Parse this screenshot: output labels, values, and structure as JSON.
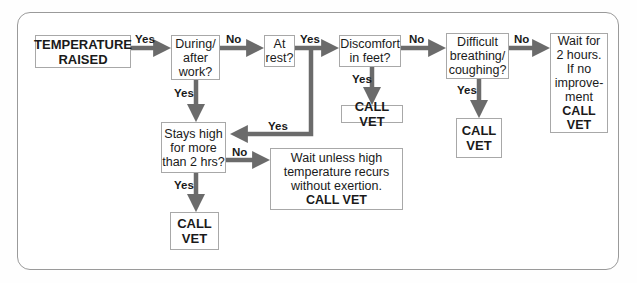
{
  "diagram": {
    "type": "flowchart",
    "arrow_color": "#6b6b6b",
    "border_color": "#a8a8a8",
    "nodes": {
      "start": "TEMPERATURE\nRAISED",
      "during_work": "During/\nafter\nwork?",
      "at_rest": "At\nrest?",
      "discomfort": "Discomfort\nin feet?",
      "breathing": "Difficult\nbreathing/\ncoughing?",
      "wait_2h": {
        "text": "Wait for\n2 hours.\nIf no\nimprove-\nment",
        "action": "CALL\nVET"
      },
      "call_vet_feet": "CALL VET",
      "call_vet_breathing": "CALL\nVET",
      "stays_high": "Stays high\nfor more\nthan 2 hrs?",
      "call_vet_stays": "CALL\nVET",
      "wait_unless": {
        "text": "Wait unless high\ntemperature recurs\nwithout exertion.",
        "action": "CALL VET"
      }
    },
    "edge_labels": {
      "start_to_during": "Yes",
      "during_to_rest": "No",
      "rest_yes": "Yes",
      "rest_to_stays": "Yes",
      "during_to_stays": "Yes",
      "discomfort_no": "No",
      "discomfort_yes": "Yes",
      "breathing_no": "No",
      "breathing_yes": "Yes",
      "stays_no": "No",
      "stays_yes": "Yes"
    }
  }
}
